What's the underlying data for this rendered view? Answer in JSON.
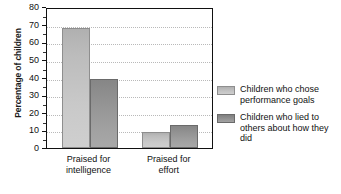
{
  "chart_data": {
    "type": "bar",
    "title": "",
    "subtitle": "",
    "xlabel": "",
    "ylabel": "Percentage of children",
    "ylim": [
      0,
      80
    ],
    "ytick_step": 10,
    "yticks": [
      "0",
      "10",
      "20",
      "30",
      "40",
      "50",
      "60",
      "70",
      "80"
    ],
    "grid": "horizontal-dotted",
    "legend_position": "right",
    "categories": [
      "Praised for intelligence",
      "Praised for effort"
    ],
    "category_lines": [
      [
        "Praised for",
        "intelligence"
      ],
      [
        "Praised for",
        "effort"
      ]
    ],
    "series": [
      {
        "name": "Children who chose performance goals",
        "color": "#c4c4c4",
        "values": [
          68,
          9
        ]
      },
      {
        "name": "Children who lied to others about how they did",
        "color": "#949494",
        "values": [
          39,
          13
        ]
      }
    ]
  },
  "legend": {
    "entries": [
      {
        "label": "Children who chose performance goals",
        "swatch": "light"
      },
      {
        "label": "Children who lied to others about how they did",
        "swatch": "dark"
      }
    ]
  },
  "axis": {
    "y_title": "Percentage of children"
  },
  "colors": {
    "series_light": "#c4c4c4",
    "series_dark": "#949494",
    "frame": "#111111",
    "gridline": "#b9b9b9",
    "text": "#111111"
  }
}
